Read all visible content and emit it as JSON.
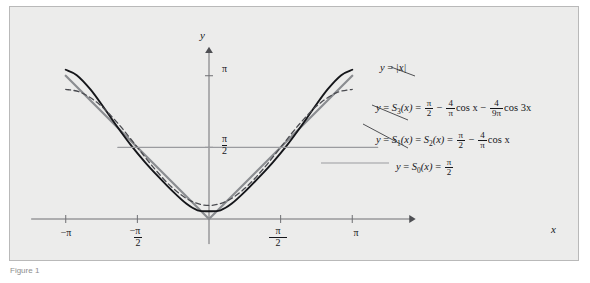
{
  "figure": {
    "background_color": "#ececeb",
    "border_color": "#b9b9b9",
    "caption": "Figure 1"
  },
  "axes": {
    "x_label": "x",
    "y_label": "y",
    "x_ticks": [
      {
        "value": -3.14159,
        "label_num": "−π",
        "label_den": ""
      },
      {
        "value": -1.5708,
        "label_num": "−π",
        "label_den": "2"
      },
      {
        "value": 1.5708,
        "label_num": "π",
        "label_den": "2"
      },
      {
        "value": 3.14159,
        "label_num": "π",
        "label_den": ""
      }
    ],
    "y_ticks": [
      {
        "value": 3.14159,
        "label_num": "π",
        "label_den": ""
      },
      {
        "value": 1.5708,
        "label_num": "π",
        "label_den": "2"
      }
    ],
    "axis_color": "#6e6f73",
    "xlim": [
      -3.9,
      4.55
    ],
    "ylim": [
      -0.55,
      3.75
    ]
  },
  "annotations": {
    "abs": {
      "text": "y = |x|",
      "lhs": "y",
      "eq": "=",
      "rhs": "|x|"
    },
    "s3": {
      "lhs_y": "y",
      "eq1": "=",
      "fn": "S",
      "sub": "3",
      "arg": "(x)",
      "eq2": "=",
      "frac1_num": "π",
      "frac1_den": "2",
      "minus1": "−",
      "frac2_num": "4",
      "frac2_den": "π",
      "cos1": "cos x",
      "minus2": "−",
      "frac3_num": "4",
      "frac3_den": "9π",
      "cos2": "cos 3x"
    },
    "s1s2": {
      "lhs_y": "y",
      "eq1": "=",
      "fn1": "S",
      "sub1": "1",
      "arg1": "(x)",
      "eq2": "=",
      "fn2": "S",
      "sub2": "2",
      "arg2": "(x)",
      "eq3": "=",
      "frac1_num": "π",
      "frac1_den": "2",
      "minus1": "−",
      "frac2_num": "4",
      "frac2_den": "π",
      "cos1": "cos x"
    },
    "s0": {
      "lhs_y": "y",
      "eq1": "=",
      "fn": "S",
      "sub": "0",
      "arg": "(x)",
      "eq2": "=",
      "frac_num": "π",
      "frac_den": "2"
    }
  },
  "chart_data": {
    "type": "line",
    "title": "",
    "xlabel": "x",
    "ylabel": "y",
    "xlim": [
      -3.9,
      4.55
    ],
    "ylim": [
      -0.55,
      3.75
    ],
    "grid": false,
    "legend_position": "right-inline-labels",
    "x_domain": [
      -3.14159,
      3.14159
    ],
    "series": [
      {
        "name": "y = |x|",
        "expression": "abs(x)",
        "style": "solid",
        "color": "#8b8d91",
        "width": 2.2,
        "points": [
          {
            "x": -3.14159,
            "y": 3.14159
          },
          {
            "x": 0,
            "y": 0
          },
          {
            "x": 3.14159,
            "y": 3.14159
          }
        ]
      },
      {
        "name": "y = S3(x)",
        "expression": "pi/2 - (4/pi)*cos(x) - (4/(9*pi))*cos(3*x)",
        "style": "solid",
        "color": "#15161a",
        "width": 1.9,
        "samples": [
          {
            "x": -3.14159,
            "y": 3.2735
          },
          {
            "x": -2.9,
            "y": 3.1548
          },
          {
            "x": -2.6,
            "y": 2.8424
          },
          {
            "x": -2.3,
            "y": 2.4341
          },
          {
            "x": -2.0,
            "y": 2.0064
          },
          {
            "x": -1.7,
            "y": 1.6031
          },
          {
            "x": -1.4,
            "y": 1.2432
          },
          {
            "x": -1.1,
            "y": 0.9172
          },
          {
            "x": -0.8,
            "y": 0.6099
          },
          {
            "x": -0.5,
            "y": 0.3377
          },
          {
            "x": -0.25,
            "y": 0.1905
          },
          {
            "x": 0,
            "y": 0.17
          },
          {
            "x": 0.25,
            "y": 0.1905
          },
          {
            "x": 0.5,
            "y": 0.3377
          },
          {
            "x": 0.8,
            "y": 0.6099
          },
          {
            "x": 1.1,
            "y": 0.9172
          },
          {
            "x": 1.4,
            "y": 1.2432
          },
          {
            "x": 1.7,
            "y": 1.6031
          },
          {
            "x": 2.0,
            "y": 2.0064
          },
          {
            "x": 2.3,
            "y": 2.4341
          },
          {
            "x": 2.6,
            "y": 2.8424
          },
          {
            "x": 2.9,
            "y": 3.1548
          },
          {
            "x": 3.14159,
            "y": 3.2735
          }
        ]
      },
      {
        "name": "y = S1(x) = S2(x)",
        "expression": "pi/2 - (4/pi)*cos(x)",
        "style": "dashed",
        "color": "#4a4b50",
        "width": 1.3,
        "samples": [
          {
            "x": -3.14159,
            "y": 2.844
          },
          {
            "x": -2.8,
            "y": 2.7709
          },
          {
            "x": -2.4,
            "y": 2.5104
          },
          {
            "x": -2.0,
            "y": 2.1009
          },
          {
            "x": -1.6,
            "y": 1.608
          },
          {
            "x": -1.2,
            "y": 1.1093
          },
          {
            "x": -0.8,
            "y": 0.684
          },
          {
            "x": -0.4,
            "y": 0.3981
          },
          {
            "x": 0,
            "y": 0.2976
          },
          {
            "x": 0.4,
            "y": 0.3981
          },
          {
            "x": 0.8,
            "y": 0.684
          },
          {
            "x": 1.2,
            "y": 1.1093
          },
          {
            "x": 1.6,
            "y": 1.608
          },
          {
            "x": 2.0,
            "y": 2.1009
          },
          {
            "x": 2.4,
            "y": 2.5104
          },
          {
            "x": 2.8,
            "y": 2.7709
          },
          {
            "x": 3.14159,
            "y": 2.844
          }
        ]
      },
      {
        "name": "y = S0(x)",
        "expression": "pi/2",
        "style": "solid",
        "color": "#9a9b9f",
        "width": 1.3,
        "points": [
          {
            "x": -2.0,
            "y": 1.5708
          },
          {
            "x": 3.7,
            "y": 1.5708
          }
        ]
      }
    ]
  }
}
